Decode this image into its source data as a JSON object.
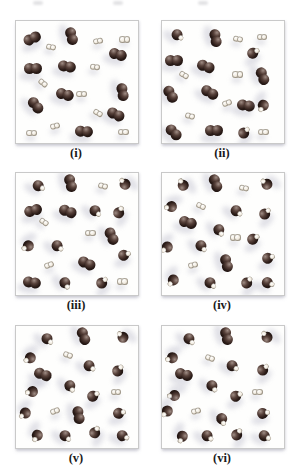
{
  "colors": {
    "page_background": "#ffffff",
    "panel_background": "#fefefd",
    "panel_border": "#c9c9c9",
    "label_color": "#1a1a1a",
    "dark_atom_core": "#2a1b17",
    "dark_atom_mid": "#57413a",
    "dark_atom_highlight": "#a08d85",
    "light_atom_fill": "#f3ede2",
    "light_atom_rim": "#847b6e",
    "shadow": "#b8b8c8"
  },
  "molecule_types": {
    "D": "dark-diatomic-pair",
    "L": "light-diatomic-pair",
    "M": "dark-light-mixed"
  },
  "top_edge_remnants_x": [
    33,
    113,
    198
  ],
  "panels": [
    {
      "label": "(i)",
      "molecules": [
        {
          "t": "D",
          "x": 13,
          "y": 14,
          "a": -25
        },
        {
          "t": "D",
          "x": 46,
          "y": 12,
          "a": 75
        },
        {
          "t": "D",
          "x": 84,
          "y": 27,
          "a": 15
        },
        {
          "t": "D",
          "x": 14,
          "y": 39,
          "a": 0
        },
        {
          "t": "D",
          "x": 42,
          "y": 37,
          "a": 10
        },
        {
          "t": "D",
          "x": 88,
          "y": 58,
          "a": 80
        },
        {
          "t": "D",
          "x": 40,
          "y": 60,
          "a": 15
        },
        {
          "t": "D",
          "x": 16,
          "y": 69,
          "a": 50
        },
        {
          "t": "D",
          "x": 82,
          "y": 76,
          "a": 25
        },
        {
          "t": "D",
          "x": 56,
          "y": 90,
          "a": 5
        },
        {
          "t": "L",
          "x": 29,
          "y": 21,
          "a": 10
        },
        {
          "t": "L",
          "x": 67,
          "y": 16,
          "a": -10
        },
        {
          "t": "L",
          "x": 89,
          "y": 15,
          "a": 0
        },
        {
          "t": "L",
          "x": 65,
          "y": 38,
          "a": 5
        },
        {
          "t": "L",
          "x": 22,
          "y": 51,
          "a": 40
        },
        {
          "t": "L",
          "x": 54,
          "y": 60,
          "a": 0
        },
        {
          "t": "L",
          "x": 67,
          "y": 75,
          "a": 30
        },
        {
          "t": "L",
          "x": 32,
          "y": 86,
          "a": -15
        },
        {
          "t": "L",
          "x": 13,
          "y": 92,
          "a": 0
        },
        {
          "t": "L",
          "x": 88,
          "y": 91,
          "a": 0
        }
      ]
    },
    {
      "label": "(ii)",
      "molecules": [
        {
          "t": "M",
          "x": 12,
          "y": 11,
          "a": 40
        },
        {
          "t": "D",
          "x": 44,
          "y": 14,
          "a": 80
        },
        {
          "t": "M",
          "x": 74,
          "y": 26,
          "a": -30
        },
        {
          "t": "D",
          "x": 10,
          "y": 32,
          "a": 0
        },
        {
          "t": "D",
          "x": 36,
          "y": 37,
          "a": 20
        },
        {
          "t": "D",
          "x": 83,
          "y": 45,
          "a": 70
        },
        {
          "t": "D",
          "x": 7,
          "y": 60,
          "a": 60
        },
        {
          "t": "D",
          "x": 39,
          "y": 58,
          "a": 30
        },
        {
          "t": "D",
          "x": 69,
          "y": 69,
          "a": 10
        },
        {
          "t": "M",
          "x": 84,
          "y": 69,
          "a": 120
        },
        {
          "t": "D",
          "x": 10,
          "y": 91,
          "a": 45
        },
        {
          "t": "D",
          "x": 43,
          "y": 90,
          "a": 0
        },
        {
          "t": "M",
          "x": 66,
          "y": 92,
          "a": -45
        },
        {
          "t": "L",
          "x": 62,
          "y": 15,
          "a": 10
        },
        {
          "t": "L",
          "x": 82,
          "y": 13,
          "a": 0
        },
        {
          "t": "L",
          "x": 18,
          "y": 44,
          "a": 30
        },
        {
          "t": "L",
          "x": 62,
          "y": 44,
          "a": 0
        },
        {
          "t": "L",
          "x": 53,
          "y": 67,
          "a": -20
        },
        {
          "t": "L",
          "x": 23,
          "y": 78,
          "a": 15
        },
        {
          "t": "L",
          "x": 83,
          "y": 91,
          "a": 0
        }
      ]
    },
    {
      "label": "(iii)",
      "molecules": [
        {
          "t": "M",
          "x": 18,
          "y": 10,
          "a": 30
        },
        {
          "t": "D",
          "x": 45,
          "y": 8,
          "a": 75
        },
        {
          "t": "L",
          "x": 71,
          "y": 11,
          "a": 15
        },
        {
          "t": "M",
          "x": 89,
          "y": 10,
          "a": -130
        },
        {
          "t": "D",
          "x": 14,
          "y": 30,
          "a": -15
        },
        {
          "t": "D",
          "x": 43,
          "y": 31,
          "a": 20
        },
        {
          "t": "M",
          "x": 65,
          "y": 30,
          "a": 45
        },
        {
          "t": "M",
          "x": 84,
          "y": 33,
          "a": -60
        },
        {
          "t": "L",
          "x": 23,
          "y": 40,
          "a": 35
        },
        {
          "t": "L",
          "x": 61,
          "y": 49,
          "a": 0
        },
        {
          "t": "D",
          "x": 79,
          "y": 52,
          "a": 65
        },
        {
          "t": "M",
          "x": 11,
          "y": 60,
          "a": 150
        },
        {
          "t": "M",
          "x": 34,
          "y": 59,
          "a": 40
        },
        {
          "t": "L",
          "x": 27,
          "y": 75,
          "a": -20
        },
        {
          "t": "D",
          "x": 58,
          "y": 74,
          "a": 25
        },
        {
          "t": "M",
          "x": 88,
          "y": 67,
          "a": -20
        },
        {
          "t": "D",
          "x": 13,
          "y": 89,
          "a": 10
        },
        {
          "t": "M",
          "x": 40,
          "y": 89,
          "a": 60
        },
        {
          "t": "M",
          "x": 70,
          "y": 90,
          "a": -45
        },
        {
          "t": "L",
          "x": 87,
          "y": 89,
          "a": 0
        }
      ]
    },
    {
      "label": "(iv)",
      "molecules": [
        {
          "t": "M",
          "x": 17,
          "y": 11,
          "a": -120
        },
        {
          "t": "D",
          "x": 44,
          "y": 8,
          "a": 70
        },
        {
          "t": "L",
          "x": 67,
          "y": 12,
          "a": 10
        },
        {
          "t": "M",
          "x": 86,
          "y": 10,
          "a": -140
        },
        {
          "t": "M",
          "x": 8,
          "y": 28,
          "a": 170
        },
        {
          "t": "L",
          "x": 32,
          "y": 27,
          "a": 25
        },
        {
          "t": "M",
          "x": 61,
          "y": 30,
          "a": 40
        },
        {
          "t": "M",
          "x": 84,
          "y": 34,
          "a": -45
        },
        {
          "t": "D",
          "x": 21,
          "y": 40,
          "a": 15
        },
        {
          "t": "M",
          "x": 47,
          "y": 46,
          "a": 60
        },
        {
          "t": "L",
          "x": 60,
          "y": 53,
          "a": 0
        },
        {
          "t": "M",
          "x": 74,
          "y": 54,
          "a": -30
        },
        {
          "t": "M",
          "x": 5,
          "y": 61,
          "a": 140
        },
        {
          "t": "M",
          "x": 32,
          "y": 59,
          "a": 50
        },
        {
          "t": "L",
          "x": 25,
          "y": 75,
          "a": -15
        },
        {
          "t": "D",
          "x": 53,
          "y": 74,
          "a": 75
        },
        {
          "t": "M",
          "x": 86,
          "y": 70,
          "a": -20
        },
        {
          "t": "M",
          "x": 10,
          "y": 88,
          "a": 130
        },
        {
          "t": "M",
          "x": 39,
          "y": 89,
          "a": 45
        },
        {
          "t": "M",
          "x": 69,
          "y": 90,
          "a": -50
        },
        {
          "t": "M",
          "x": 86,
          "y": 89,
          "a": 20
        }
      ]
    },
    {
      "label": "(v)",
      "molecules": [
        {
          "t": "M",
          "x": 25,
          "y": 10,
          "a": 45
        },
        {
          "t": "D",
          "x": 56,
          "y": 8,
          "a": 70
        },
        {
          "t": "M",
          "x": 88,
          "y": 10,
          "a": -135
        },
        {
          "t": "M",
          "x": 12,
          "y": 26,
          "a": 150
        },
        {
          "t": "L",
          "x": 43,
          "y": 24,
          "a": 20
        },
        {
          "t": "M",
          "x": 60,
          "y": 32,
          "a": 40
        },
        {
          "t": "D",
          "x": 22,
          "y": 39,
          "a": 20
        },
        {
          "t": "M",
          "x": 83,
          "y": 37,
          "a": -50
        },
        {
          "t": "M",
          "x": 44,
          "y": 48,
          "a": 60
        },
        {
          "t": "M",
          "x": 14,
          "y": 54,
          "a": 170
        },
        {
          "t": "M",
          "x": 62,
          "y": 57,
          "a": -30
        },
        {
          "t": "L",
          "x": 82,
          "y": 54,
          "a": 0
        },
        {
          "t": "L",
          "x": 32,
          "y": 70,
          "a": -20
        },
        {
          "t": "D",
          "x": 52,
          "y": 73,
          "a": 80
        },
        {
          "t": "M",
          "x": 84,
          "y": 71,
          "a": -15
        },
        {
          "t": "M",
          "x": 8,
          "y": 71,
          "a": 140
        },
        {
          "t": "M",
          "x": 18,
          "y": 89,
          "a": 120
        },
        {
          "t": "M",
          "x": 40,
          "y": 89,
          "a": 45
        },
        {
          "t": "M",
          "x": 64,
          "y": 88,
          "a": -60
        },
        {
          "t": "M",
          "x": 87,
          "y": 89,
          "a": 25
        }
      ]
    },
    {
      "label": "(vi)",
      "molecules": [
        {
          "t": "M",
          "x": 22,
          "y": 10,
          "a": 50
        },
        {
          "t": "D",
          "x": 53,
          "y": 8,
          "a": 75
        },
        {
          "t": "M",
          "x": 86,
          "y": 10,
          "a": -130
        },
        {
          "t": "M",
          "x": 9,
          "y": 26,
          "a": 160
        },
        {
          "t": "L",
          "x": 39,
          "y": 26,
          "a": 20
        },
        {
          "t": "M",
          "x": 57,
          "y": 32,
          "a": 35
        },
        {
          "t": "D",
          "x": 18,
          "y": 39,
          "a": 15
        },
        {
          "t": "M",
          "x": 82,
          "y": 36,
          "a": -45
        },
        {
          "t": "M",
          "x": 41,
          "y": 48,
          "a": 55
        },
        {
          "t": "M",
          "x": 11,
          "y": 57,
          "a": 175
        },
        {
          "t": "M",
          "x": 60,
          "y": 57,
          "a": -25
        },
        {
          "t": "L",
          "x": 78,
          "y": 54,
          "a": 0
        },
        {
          "t": "L",
          "x": 28,
          "y": 70,
          "a": -15
        },
        {
          "t": "M",
          "x": 49,
          "y": 75,
          "a": 70
        },
        {
          "t": "M",
          "x": 82,
          "y": 71,
          "a": -10
        },
        {
          "t": "M",
          "x": 5,
          "y": 70,
          "a": 135
        },
        {
          "t": "M",
          "x": 17,
          "y": 90,
          "a": 115
        },
        {
          "t": "M",
          "x": 37,
          "y": 89,
          "a": 40
        },
        {
          "t": "M",
          "x": 61,
          "y": 89,
          "a": -55
        },
        {
          "t": "M",
          "x": 84,
          "y": 89,
          "a": 30
        }
      ]
    }
  ],
  "layout_cells": [
    {
      "x": 15,
      "y": 20
    },
    {
      "x": 161,
      "y": 20
    },
    {
      "x": 15,
      "y": 172
    },
    {
      "x": 161,
      "y": 172
    },
    {
      "x": 15,
      "y": 325
    },
    {
      "x": 161,
      "y": 325
    }
  ]
}
